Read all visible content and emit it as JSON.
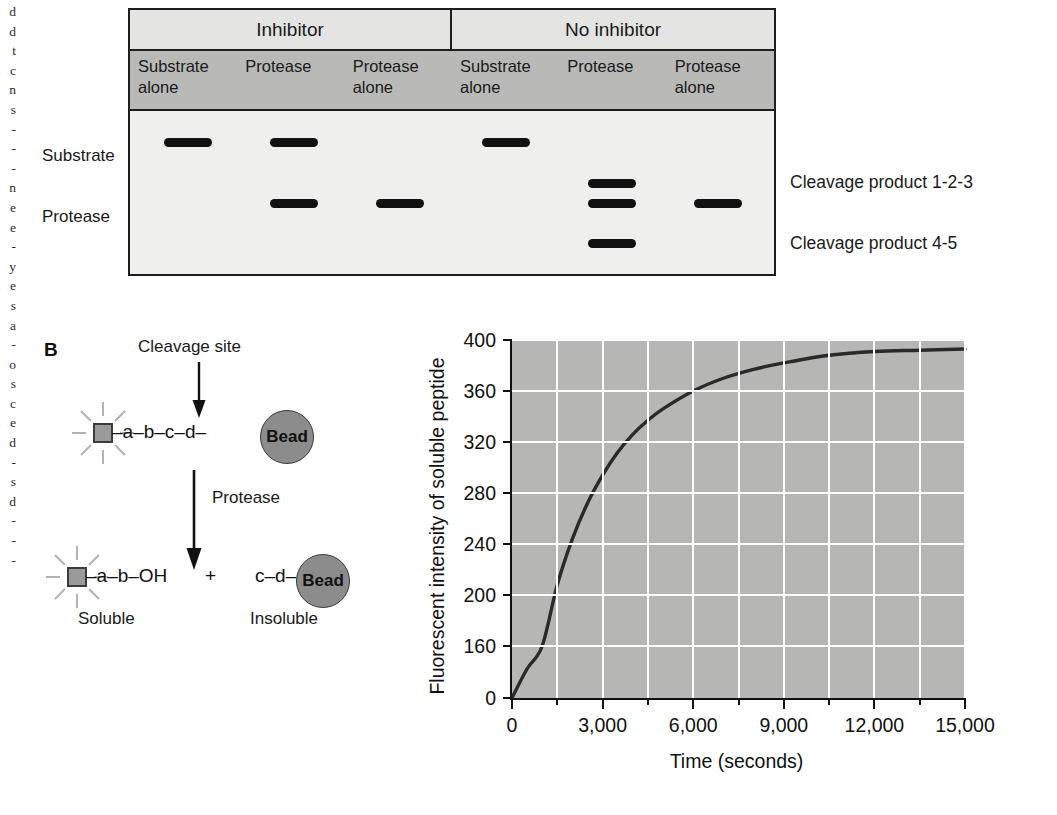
{
  "bleed_column": {
    "fragments": "d\nd\nt\nc\nn\ns\n-\n-\n-\nn\ne\ne\n-\ny\ne\ns\na\n-\no\ns\nc\ne\nd\n-\ns\nd\n-\n-\n-"
  },
  "panel_a": {
    "group_headers": [
      {
        "label": "Inhibitor"
      },
      {
        "label": "No inhibitor"
      }
    ],
    "lane_headers": [
      {
        "line1": "Substrate",
        "line2": "alone"
      },
      {
        "line1": "Protease",
        "line2": ""
      },
      {
        "line1": "Protease",
        "line2": "alone"
      },
      {
        "line1": "Substrate",
        "line2": "alone"
      },
      {
        "line1": "Protease",
        "line2": ""
      },
      {
        "line1": "Protease",
        "line2": "alone"
      }
    ],
    "row_labels": [
      {
        "label": "Substrate"
      },
      {
        "label": "Protease"
      }
    ],
    "callouts": [
      {
        "label": "Cleavage product 1-2-3"
      },
      {
        "label": "Cleavage product 4-5"
      }
    ],
    "bands": [
      {
        "lane": 1,
        "row": "substrate"
      },
      {
        "lane": 2,
        "row": "substrate"
      },
      {
        "lane": 2,
        "row": "protease"
      },
      {
        "lane": 3,
        "row": "protease"
      },
      {
        "lane": 4,
        "row": "substrate"
      },
      {
        "lane": 5,
        "row": "product123"
      },
      {
        "lane": 5,
        "row": "protease"
      },
      {
        "lane": 5,
        "row": "product45"
      },
      {
        "lane": 6,
        "row": "protease"
      }
    ]
  },
  "panel_b": {
    "letter": "B",
    "cleavage_site_label": "Cleavage site",
    "reaction_arrow_label": "Protease",
    "substrate_chain": "–a–b–c–d–",
    "bead_label": "Bead",
    "product_soluble_chain": "–a–b–OH",
    "plus_sign": "+",
    "product_insoluble_chain": "c–d–",
    "soluble_label": "Soluble",
    "insoluble_label": "Insoluble"
  },
  "chart_data": {
    "type": "line",
    "title": "",
    "xlabel": "Time (seconds)",
    "ylabel": "Fluorescent intensity of soluble peptide",
    "xlim": [
      0,
      15000
    ],
    "ylim": [
      0,
      400
    ],
    "xticks": [
      0,
      3000,
      6000,
      9000,
      12000,
      15000
    ],
    "xtick_labels": [
      "0",
      "3,000",
      "6,000",
      "9,000",
      "12,000",
      "15,000"
    ],
    "xminor_step": 1500,
    "yticks": [
      0,
      160,
      200,
      240,
      280,
      320,
      360,
      400
    ],
    "ytick_labels": [
      "0",
      "160",
      "200",
      "240",
      "280",
      "320",
      "360",
      "400"
    ],
    "y_axis_break": true,
    "grid": true,
    "grid_color": "#ffffff",
    "plot_background": "#b6b6b5",
    "line_color": "#2a2a2a",
    "legend": "none",
    "series": [
      {
        "name": "Fluorescent intensity of soluble peptide",
        "x": [
          0,
          500,
          1000,
          1500,
          2000,
          2500,
          3000,
          3500,
          4000,
          4500,
          5000,
          6000,
          7000,
          8000,
          9000,
          10500,
          12000,
          13500,
          15000
        ],
        "y": [
          0,
          90,
          160,
          208,
          244,
          272,
          294,
          312,
          326,
          337,
          346,
          360,
          370,
          377,
          382,
          388,
          391,
          392,
          393
        ]
      }
    ]
  }
}
